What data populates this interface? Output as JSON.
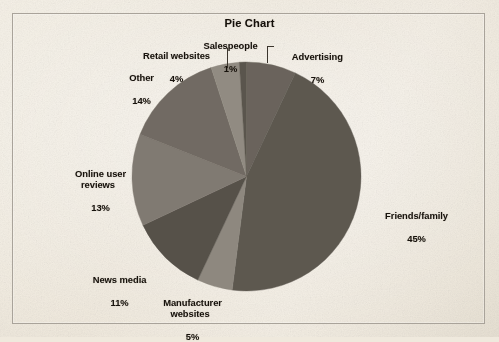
{
  "page": {
    "background_color": "#efe9dd",
    "frame_color": "#a9a39a"
  },
  "chart_data": {
    "type": "pie",
    "title": "Pie Chart",
    "xlabel": "",
    "ylabel": "",
    "legend_position": "none",
    "grid": false,
    "labels_show_percent": true,
    "start_angle_deg": 0,
    "direction": "clockwise",
    "categories": [
      "Advertising",
      "Friends/family",
      "Manufacturer websites",
      "News media",
      "Online user reviews",
      "Other",
      "Retail websites",
      "Salespeople"
    ],
    "values": [
      7,
      45,
      5,
      11,
      13,
      14,
      4,
      1
    ],
    "slices": [
      {
        "label": "Advertising",
        "value": 7,
        "percent_text": "7%",
        "color": "#6a645c",
        "start_deg": 0,
        "end_deg": 25.2
      },
      {
        "label": "Friends/family",
        "value": 45,
        "percent_text": "45%",
        "color": "#5d5850",
        "start_deg": 25.2,
        "end_deg": 187.2
      },
      {
        "label": "Manufacturer websites",
        "value": 5,
        "percent_text": "5%",
        "color": "#8e887f",
        "start_deg": 187.2,
        "end_deg": 205.2
      },
      {
        "label": "News media",
        "value": 11,
        "percent_text": "11%",
        "color": "#56514a",
        "start_deg": 205.2,
        "end_deg": 244.8
      },
      {
        "label": "Online user reviews",
        "value": 13,
        "percent_text": "13%",
        "color": "#807a72",
        "start_deg": 244.8,
        "end_deg": 291.6
      },
      {
        "label": "Other",
        "value": 14,
        "percent_text": "14%",
        "color": "#716b63",
        "start_deg": 291.6,
        "end_deg": 342.0
      },
      {
        "label": "Retail websites",
        "value": 4,
        "percent_text": "4%",
        "color": "#918b82",
        "start_deg": 342.0,
        "end_deg": 356.4
      },
      {
        "label": "Salespeople",
        "value": 1,
        "percent_text": "1%",
        "color": "#5a554d",
        "start_deg": 356.4,
        "end_deg": 360.0
      }
    ]
  },
  "labels": {
    "advertising": {
      "name": "Advertising",
      "percent": "7%"
    },
    "friends": {
      "name": "Friends/family",
      "percent": "45%"
    },
    "manufacturer": {
      "name": "Manufacturer\nwebsites",
      "percent": "5%"
    },
    "news": {
      "name": "News media",
      "percent": "11%"
    },
    "reviews": {
      "name": "Online user\nreviews",
      "percent": "13%"
    },
    "other": {
      "name": "Other",
      "percent": "14%"
    },
    "retail": {
      "name": "Retail websites",
      "percent": "4%"
    },
    "salespeople": {
      "name": "Salespeople",
      "percent": "1%"
    }
  }
}
